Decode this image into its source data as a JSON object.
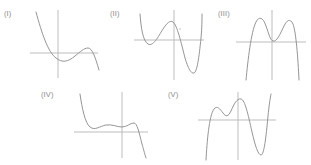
{
  "page": {
    "background_color": "#ffffff",
    "curve_color": "#8f8f8f",
    "axis_color": "#b5b5b5",
    "label_color": "#8a8a8a",
    "width": 311,
    "height": 165
  },
  "figures": [
    {
      "id": "fig-1",
      "label": "(I)",
      "label_x": 4,
      "label_y": 9,
      "frame": {
        "x": 28,
        "y": 8,
        "width": 72,
        "height": 72
      },
      "axes": {
        "x_axis": {
          "x1": 2,
          "y1": 45,
          "x2": 70,
          "y2": 45
        },
        "y_axis": {
          "x1": 30,
          "y1": 2,
          "x2": 30,
          "y2": 70
        }
      },
      "curve_path": "M 8 4 C 14 26, 20 44, 28 50 C 34 55, 40 54, 47 48 C 52 44, 56 40, 60 40 C 64 40, 67 48, 71 62",
      "shape": "cubic with local minimum left of origin and local maximum right of origin, falling at far right",
      "degree": 3,
      "leading_coefficient_sign": "negative",
      "turning_points": 2
    },
    {
      "id": "fig-2",
      "label": "(II)",
      "label_x": 110,
      "label_y": 9,
      "frame": {
        "x": 132,
        "y": 8,
        "width": 76,
        "height": 74
      },
      "axes": {
        "x_axis": {
          "x1": 2,
          "y1": 32,
          "x2": 72,
          "y2": 32
        },
        "y_axis": {
          "x1": 42,
          "y1": 2,
          "x2": 42,
          "y2": 72
        }
      },
      "curve_path": "M 8 6 C 9 20, 11 33, 16 36 C 21 39, 26 29, 31 21 C 35 15, 38 12, 41 14 C 45 17, 49 34, 53 50 C 56 60, 59 66, 62 65 C 65 64, 67 50, 69 30 C 70 20, 70 12, 70 6",
      "shape": "quartic W shape: local min left of y-axis, local max near y-axis, deep local min right of y-axis",
      "degree": 4,
      "leading_coefficient_sign": "positive",
      "turning_points": 3,
      "speck": {
        "cx": 48,
        "cy": 21,
        "r": 0.8
      }
    },
    {
      "id": "fig-3",
      "label": "(III)",
      "label_x": 218,
      "label_y": 9,
      "frame": {
        "x": 236,
        "y": 8,
        "width": 72,
        "height": 74
      },
      "axes": {
        "x_axis": {
          "x1": 0,
          "y1": 34,
          "x2": 70,
          "y2": 34
        },
        "y_axis": {
          "x1": 36,
          "y1": 2,
          "x2": 36,
          "y2": 72
        }
      },
      "curve_path": "M 10 72 C 12 52, 15 24, 20 14 C 23 8, 27 9, 30 18 C 33 26, 34 32, 37 33 C 41 34, 44 26, 48 18 C 51 12, 54 10, 57 16 C 60 24, 62 50, 63 72",
      "shape": "quartic M shape: two local maxima with a local minimum near the y-axis, falling at both ends",
      "degree": 4,
      "leading_coefficient_sign": "negative",
      "turning_points": 3
    },
    {
      "id": "fig-4",
      "label": "(IV)",
      "label_x": 41,
      "label_y": 90,
      "frame": {
        "x": 72,
        "y": 90,
        "width": 82,
        "height": 72
      },
      "axes": {
        "x_axis": {
          "x1": 2,
          "y1": 42,
          "x2": 76,
          "y2": 42
        },
        "y_axis": {
          "x1": 50,
          "y1": 2,
          "x2": 50,
          "y2": 68
        }
      },
      "curve_path": "M 8 4 C 10 18, 13 33, 18 37 C 23 41, 28 36, 34 35 C 40 34, 45 37, 50 37 C 55 37, 58 33, 62 33 C 65 33, 67 42, 70 54 C 72 61, 73 65, 74 68",
      "shape": "high degree polynomial: steep fall from upper left into a shallow wavy plateau just above the x-axis, small local maximum, then steep fall at the right",
      "degree": 5,
      "leading_coefficient_sign": "negative",
      "turning_points": 4
    },
    {
      "id": "fig-5",
      "label": "(V)",
      "label_x": 168,
      "label_y": 90,
      "frame": {
        "x": 196,
        "y": 90,
        "width": 86,
        "height": 72
      },
      "axes": {
        "x_axis": {
          "x1": 2,
          "y1": 30,
          "x2": 80,
          "y2": 30
        },
        "y_axis": {
          "x1": 42,
          "y1": 2,
          "x2": 42,
          "y2": 70
        }
      },
      "curve_path": "M 10 70 C 11 52, 13 26, 18 19 C 21 15, 24 19, 27 23 C 30 27, 32 27, 35 21 C 38 14, 41 8, 45 9 C 49 10, 52 24, 56 42 C 59 55, 62 65, 65 65 C 68 65, 70 48, 72 26 C 73 16, 74 9, 75 4",
      "shape": "high degree polynomial: local maximum, shallow local minimum, higher local maximum right of the y-axis, deep local minimum, then steep rise",
      "degree": 5,
      "leading_coefficient_sign": "positive",
      "turning_points": 4
    }
  ]
}
